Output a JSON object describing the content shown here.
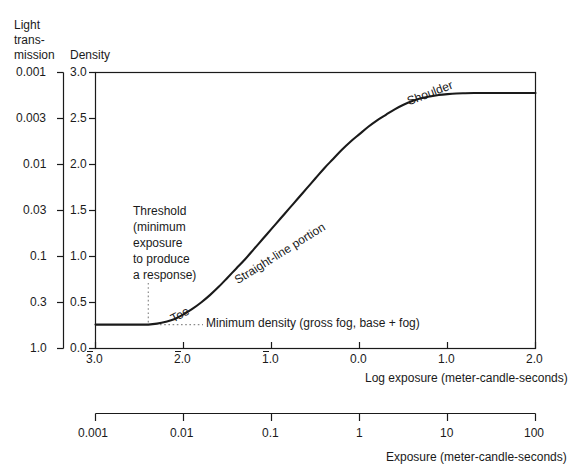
{
  "figure": {
    "background": "#ffffff",
    "ink": "#1a1a1a",
    "curve_color": "#1a1a1a"
  },
  "left_axis": {
    "title_lines": [
      "Light",
      "trans-",
      "mission"
    ],
    "title": "Light transmission",
    "ticks": [
      "0.001",
      "0.003",
      "0.01",
      "0.03",
      "0.1",
      "0.3",
      "1.0"
    ]
  },
  "y_axis": {
    "title": "Density",
    "ticks": [
      "3.0",
      "2.5",
      "2.0",
      "1.5",
      "1.0",
      "0.5",
      "0.0"
    ],
    "values": [
      3.0,
      2.5,
      2.0,
      1.5,
      1.0,
      0.5,
      0.0
    ],
    "range": [
      0.0,
      3.0
    ]
  },
  "x_axis": {
    "title": "Log exposure (meter-candle-seconds)",
    "ticks": [
      "3.0",
      "2.0",
      "1.0",
      "0.0",
      "1.0",
      "2.0"
    ],
    "tick_negative": [
      true,
      true,
      true,
      false,
      false,
      false
    ],
    "values": [
      -3.0,
      -2.0,
      -1.0,
      0.0,
      1.0,
      2.0
    ],
    "range": [
      -3.0,
      2.0
    ],
    "note": "negative values shown with overbar notation"
  },
  "x_axis2": {
    "title": "Exposure (meter-candle-seconds)",
    "ticks": [
      "0.001",
      "0.01",
      "0.1",
      "1",
      "10",
      "100"
    ],
    "values": [
      0.001,
      0.01,
      0.1,
      1,
      10,
      100
    ],
    "scale": "log"
  },
  "annotations": {
    "threshold": {
      "lines": [
        "Threshold",
        "(minimum",
        "exposure",
        "to produce",
        "a response)"
      ],
      "text": "Threshold (minimum exposure to produce a response)",
      "marker": "dotted-vertical-line",
      "log_exposure": -2.4
    },
    "toe": {
      "text": "Toe",
      "rotation_deg": -28,
      "log_exposure": -2.05
    },
    "straight_line": {
      "text": "Straight-line portion",
      "rotation_deg": -32,
      "log_exposure": -0.85
    },
    "shoulder": {
      "text": "Shoulder",
      "rotation_deg": -21,
      "log_exposure": 1.05
    },
    "minimum_density": {
      "text": "Minimum density (gross fog, base + fog)",
      "marker": "dotted-horizontal-line",
      "density": 0.26
    }
  },
  "chart_data": {
    "type": "line",
    "title": "",
    "subtitle": "",
    "xlabel": "Log exposure (meter-candle-seconds)",
    "ylabel": "Density",
    "xlim": [
      -3.0,
      2.0
    ],
    "ylim": [
      0.0,
      3.0
    ],
    "grid": false,
    "legend": null,
    "secondary_xlabel": "Exposure (meter-candle-seconds)",
    "secondary_ylabel": "Light transmission",
    "series": [
      {
        "name": "Characteristic (D-log E) curve",
        "x": [
          -3.0,
          -2.8,
          -2.6,
          -2.5,
          -2.4,
          -2.3,
          -2.2,
          -2.1,
          -2.0,
          -1.9,
          -1.8,
          -1.7,
          -1.6,
          -1.5,
          -1.4,
          -1.3,
          -1.2,
          -1.1,
          -1.0,
          -0.9,
          -0.8,
          -0.7,
          -0.6,
          -0.5,
          -0.4,
          -0.3,
          -0.2,
          -0.1,
          0.0,
          0.1,
          0.2,
          0.3,
          0.4,
          0.5,
          0.6,
          0.7,
          0.8,
          0.9,
          1.0,
          1.1,
          1.2,
          1.3,
          1.4,
          1.5,
          1.6,
          1.7,
          1.8,
          1.9,
          2.0
        ],
        "y": [
          0.26,
          0.26,
          0.26,
          0.26,
          0.26,
          0.27,
          0.29,
          0.32,
          0.37,
          0.43,
          0.5,
          0.58,
          0.67,
          0.77,
          0.87,
          0.97,
          1.08,
          1.19,
          1.3,
          1.41,
          1.52,
          1.63,
          1.74,
          1.85,
          1.96,
          2.06,
          2.16,
          2.25,
          2.33,
          2.41,
          2.48,
          2.54,
          2.6,
          2.65,
          2.69,
          2.72,
          2.74,
          2.755,
          2.765,
          2.772,
          2.775,
          2.777,
          2.777,
          2.777,
          2.777,
          2.777,
          2.777,
          2.777,
          2.777
        ]
      }
    ],
    "annotations": [
      {
        "label": "Toe",
        "x": -2.05,
        "y": 0.4
      },
      {
        "label": "Straight-line portion",
        "x": -0.85,
        "y": 1.45
      },
      {
        "label": "Shoulder",
        "x": 1.05,
        "y": 2.77
      },
      {
        "label": "Threshold (minimum exposure to produce a response)",
        "x": -2.4,
        "y": 0.26
      },
      {
        "label": "Minimum density (gross fog, base + fog)",
        "x": -1.6,
        "y": 0.26
      }
    ]
  }
}
